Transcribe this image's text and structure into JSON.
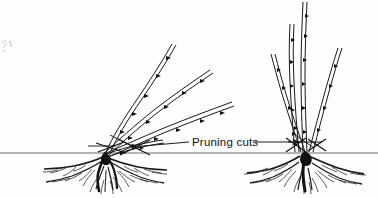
{
  "illustration": {
    "type": "line-drawing",
    "subject": "shrub pruning diagram",
    "ink_color": "#1a1a1a",
    "background_color": "#ffffff",
    "ground_line_y": 153,
    "annotations": {
      "pruning_cuts_label": "Pruning cuts"
    },
    "figures": [
      {
        "name": "left-plant",
        "description": "shrub with canes angled to the upper right, pruning cuts marked near the crown",
        "base_x": 105,
        "cane_orientation": "oblique",
        "cane_count": 4
      },
      {
        "name": "right-plant",
        "description": "shrub with upright vase-shaped canes, pruning cuts marked near the crown",
        "base_x": 305,
        "cane_orientation": "upright",
        "cane_count": 4
      }
    ]
  }
}
